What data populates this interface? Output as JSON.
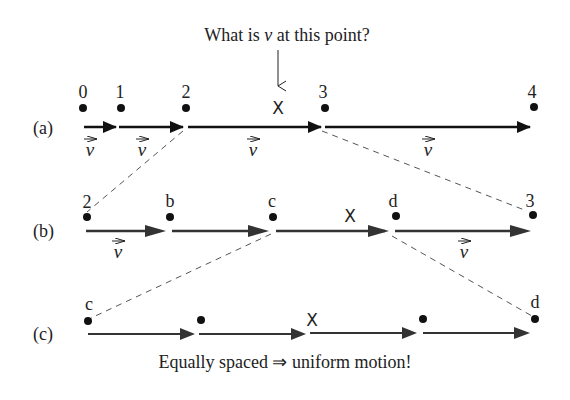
{
  "question": {
    "prefix": "What is ",
    "variable": "v",
    "suffix": " at this point?"
  },
  "conclusion": "Equally spaced ⇒ uniform motion!",
  "vector_symbol": "v",
  "marker": "X",
  "rows": [
    {
      "label": "(a)",
      "points": [
        {
          "label": "0",
          "x": 83
        },
        {
          "label": "1",
          "x": 120
        },
        {
          "label": "2",
          "x": 186
        },
        {
          "label": "3",
          "x": 324
        },
        {
          "label": "4",
          "x": 534
        }
      ],
      "x_marker_x": 290,
      "vector_labels_x": [
        85,
        147,
        245,
        427
      ]
    },
    {
      "label": "(b)",
      "points": [
        {
          "label": "2",
          "x": 87
        },
        {
          "label": "b",
          "x": 170
        },
        {
          "label": "c",
          "x": 272
        },
        {
          "label": "d",
          "x": 395
        },
        {
          "label": "3",
          "x": 530
        }
      ],
      "x_marker_x": 345,
      "vector_labels_x": [
        117,
        463
      ]
    },
    {
      "label": "(c)",
      "points": [
        {
          "label": "c",
          "x": 88
        },
        {
          "label": "",
          "x": 203
        },
        {
          "label": "",
          "x": 424
        },
        {
          "label": "d",
          "x": 536
        }
      ],
      "x_marker_x": 312
    }
  ],
  "colors": {
    "ink": "#222222",
    "dash": "#555555",
    "arrow_row_a": "#111111",
    "arrow_rows_bc": "#333333"
  }
}
